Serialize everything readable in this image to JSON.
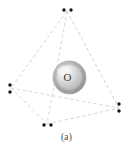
{
  "figure": {
    "caption": "(a)",
    "central_atom_label": "O",
    "background_color": "#ffffff",
    "geometry_name": "tetrahedron",
    "edge_color": "#cfcfcf",
    "edge_style": "dashed",
    "edge_width": 0.9,
    "dot_color": "#1a1a1a",
    "dot_radius": 1.6,
    "sphere": {
      "center_x": 69.5,
      "center_y": 77.5,
      "radius": 16.5,
      "highlight_color": "#f2f2f2",
      "mid_color": "#c9c9c9",
      "edge_color": "#9a9a9a",
      "ring_color": "#b5b5b5"
    },
    "vertices": [
      {
        "name": "top",
        "x": 67,
        "y": 11
      },
      {
        "name": "left",
        "x": 11,
        "y": 88
      },
      {
        "name": "right",
        "x": 119,
        "y": 108
      },
      {
        "name": "bottom",
        "x": 47,
        "y": 124
      }
    ],
    "edges": [
      {
        "from": "top",
        "to": "left"
      },
      {
        "from": "top",
        "to": "right"
      },
      {
        "from": "top",
        "to": "bottom"
      },
      {
        "from": "left",
        "to": "right"
      },
      {
        "from": "left",
        "to": "bottom"
      },
      {
        "from": "bottom",
        "to": "right"
      }
    ],
    "lone_pairs": [
      {
        "vertex": "top",
        "orientation": "horizontal",
        "dots": [
          {
            "x": 64,
            "y": 10
          },
          {
            "x": 71,
            "y": 10
          }
        ]
      },
      {
        "vertex": "left",
        "orientation": "vertical",
        "dots": [
          {
            "x": 10,
            "y": 85
          },
          {
            "x": 10,
            "y": 92
          }
        ]
      },
      {
        "vertex": "right",
        "orientation": "vertical",
        "dots": [
          {
            "x": 119,
            "y": 104
          },
          {
            "x": 119,
            "y": 111
          }
        ]
      },
      {
        "vertex": "bottom",
        "orientation": "horizontal",
        "dots": [
          {
            "x": 44,
            "y": 125
          },
          {
            "x": 51,
            "y": 125
          }
        ]
      }
    ]
  }
}
